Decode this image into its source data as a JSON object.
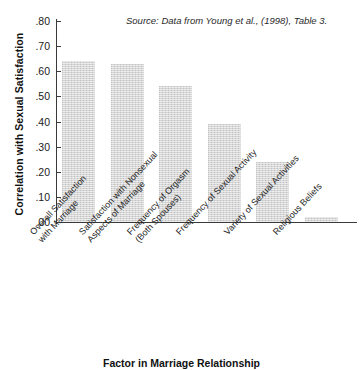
{
  "chart_data": {
    "type": "bar",
    "title": "",
    "subtitle": "",
    "xlabel": "Factor in Marriage Relationship",
    "ylabel": "Correlation with Sexual Satisfaction",
    "categories": [
      "Overall Satisfaction with Marriage",
      "Satisfaction with Nonsexual Aspects of Marriage",
      "Frequency of Orgasm (Both Spouses)",
      "Frequency of Sexual Activity",
      "Variety of Sexual Activities",
      "Religious Beliefs"
    ],
    "category_lines": [
      [
        "Overall Satisfaction",
        "with Marriage"
      ],
      [
        "Satisfaction with Nonsexual",
        "Aspects of Marriage"
      ],
      [
        "Frequency of Orgasm",
        "(Both Spouses)"
      ],
      [
        "Frequency of Sexual Activity"
      ],
      [
        "Variety of Sexual Activities"
      ],
      [
        "Religious Beliefs"
      ]
    ],
    "values": [
      0.64,
      0.63,
      0.54,
      0.39,
      0.24,
      0.02
    ],
    "ylim": [
      0.0,
      0.8
    ],
    "ytick_step": 0.1,
    "ytick_labels": [
      ".80",
      ".70",
      ".60",
      ".50",
      ".40",
      ".30",
      ".20",
      ".10",
      ".00"
    ],
    "ytick_values": [
      0.8,
      0.7,
      0.6,
      0.5,
      0.4,
      0.3,
      0.2,
      0.1,
      0.0
    ],
    "grid": false,
    "legend": null,
    "bar_color": "#d6d6d6",
    "axis_color": "#3a3a3a",
    "annotations": [
      {
        "name": "source-note",
        "text": "Source: Data from Young et al., (1998), Table 3."
      }
    ]
  },
  "figure": {
    "source_note": "Source: Data from Young et al., (1998), Table 3.",
    "y_axis_title": "Correlation with Sexual Satisfaction",
    "x_axis_title": "Factor in Marriage Relationship",
    "top_artifact": ""
  }
}
